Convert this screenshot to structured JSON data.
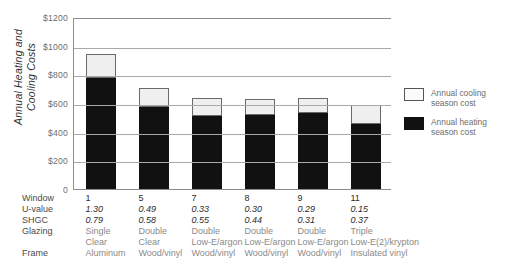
{
  "chart_data": {
    "type": "bar",
    "title": "",
    "subtitle": "",
    "xlabel": "",
    "ylabel": "Annual Heating and Cooling Costs",
    "ylabel_lines": [
      "Annual Heating and",
      "Cooling Costs"
    ],
    "ylim": [
      0,
      1200
    ],
    "ytick_values": [
      0,
      200,
      400,
      600,
      800,
      1000,
      1200
    ],
    "ytick_labels": [
      "0",
      "$200",
      "$400",
      "$600",
      "$800",
      "$1000",
      "$1200"
    ],
    "grid": true,
    "stacked": true,
    "legend_position": "right",
    "categories": [
      "1",
      "5",
      "7",
      "8",
      "9",
      "11"
    ],
    "series": [
      {
        "name": "Annual heating season cost",
        "color": "#111111",
        "values": [
          780,
          580,
          515,
          520,
          535,
          460
        ]
      },
      {
        "name": "Annual cooling season cost",
        "color": "#efefef",
        "values": [
          170,
          135,
          130,
          115,
          105,
          130
        ]
      }
    ],
    "totals": [
      950,
      715,
      645,
      635,
      640,
      590
    ]
  },
  "legend": {
    "items": [
      {
        "label_lines": [
          "Annual cooling",
          "season cost"
        ],
        "swatch": "cool"
      },
      {
        "label_lines": [
          "Annual heating",
          "season cost"
        ],
        "swatch": "heat"
      }
    ]
  },
  "table": {
    "row_labels": [
      "Window",
      "U-value",
      "SHGC",
      "Glazing",
      "",
      "Frame"
    ],
    "rows": [
      {
        "label": "Window",
        "kind": "win",
        "values": [
          "1",
          "5",
          "7",
          "8",
          "9",
          "11"
        ]
      },
      {
        "label": "U-value",
        "kind": "num",
        "values": [
          "1.30",
          "0.49",
          "0.33",
          "0.30",
          "0.29",
          "0.15"
        ]
      },
      {
        "label": "SHGC",
        "kind": "num",
        "values": [
          "0.79",
          "0.58",
          "0.55",
          "0.44",
          "0.31",
          "0.37"
        ]
      },
      {
        "label": "Glazing",
        "kind": "txt",
        "values": [
          "Single",
          "Double",
          "Double",
          "Double",
          "Double",
          "Triple"
        ]
      },
      {
        "label": "",
        "kind": "txt",
        "values": [
          "Clear",
          "Clear",
          "Low-E/argon",
          "Low-E/argon",
          "Low-E/argon",
          "Low-E(2)/krypton"
        ]
      },
      {
        "label": "Frame",
        "kind": "txt",
        "values": [
          "Aluminum",
          "Wood/vinyl",
          "Wood/vinyl",
          "Wood/vinyl",
          "Wood/vinyl",
          "Insulated vinyl"
        ]
      }
    ]
  }
}
